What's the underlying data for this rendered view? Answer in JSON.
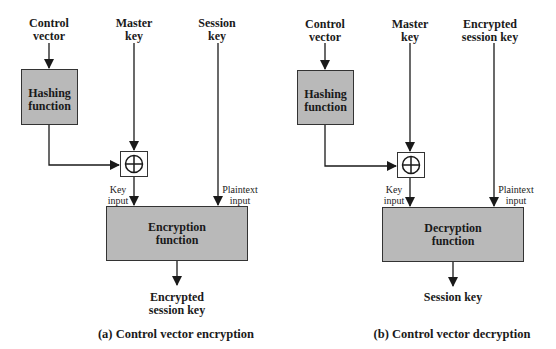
{
  "panel_a": {
    "inputs": {
      "control_vector": "Control\nvector",
      "master_key": "Master\nkey",
      "session_key": "Session\nkey"
    },
    "hashing_box": "Hashing\nfunction",
    "xor_symbol": "⊕",
    "key_input_label": "Key\ninput",
    "plaintext_input_label": "Plaintext\ninput",
    "function_box": "Encryption\nfunction",
    "output": "Encrypted\nsession key",
    "caption": "(a) Control vector encryption"
  },
  "panel_b": {
    "inputs": {
      "control_vector": "Control\nvector",
      "master_key": "Master\nkey",
      "session_key": "Encrypted\nsession key"
    },
    "hashing_box": "Hashing\nfunction",
    "xor_symbol": "⊕",
    "key_input_label": "Key\ninput",
    "plaintext_input_label": "Plaintext\ninput",
    "function_box": "Decryption\nfunction",
    "output": "Session key",
    "caption": "(b) Control vector decryption"
  },
  "colors": {
    "box_fill": "#b9b9b9",
    "line": "#1a1a1a",
    "background": "#ffffff"
  }
}
